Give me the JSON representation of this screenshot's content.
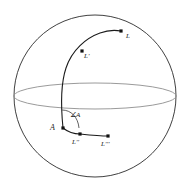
{
  "figure": {
    "colors": {
      "outline": "#2b2b2b",
      "equator": "#8c8c8c",
      "curve": "#1a1a1a",
      "point": "#111111",
      "background": "#ffffff"
    },
    "sphere": {
      "name": "sphere-outline",
      "center_x": 95,
      "center_y": 96,
      "radius": 81
    },
    "equator": {
      "name": "equator-ellipse",
      "center_x": 95,
      "center_y": 96,
      "radius_x": 81,
      "radius_y": 13
    },
    "points": [
      {
        "id": "L",
        "label": "L",
        "x": 121,
        "y": 31
      },
      {
        "id": "Lp",
        "label": "L'",
        "x": 82,
        "y": 51
      },
      {
        "id": "A",
        "label": "A",
        "x": 63,
        "y": 128
      },
      {
        "id": "Lpp",
        "label": "L''",
        "x": 80,
        "y": 134
      },
      {
        "id": "Lppp",
        "label": "L'''",
        "x": 108,
        "y": 136
      }
    ],
    "angle": {
      "name": "angle-A",
      "label": "∠A",
      "vertex_x": 63,
      "vertex_y": 128
    },
    "meridian": {
      "name": "meridian-arc",
      "from": "A",
      "through": "L'",
      "to": "L"
    },
    "baseline": {
      "name": "base-arc",
      "from": "A",
      "through": "L''",
      "to": "L'''"
    }
  }
}
